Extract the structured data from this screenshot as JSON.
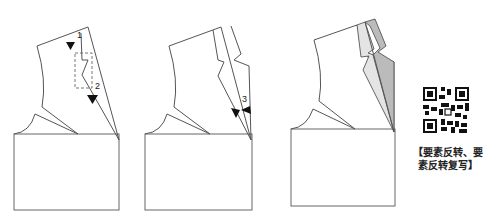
{
  "figure": {
    "panels": [
      {
        "id": "panel-1",
        "labels": [
          "1",
          "2"
        ]
      },
      {
        "id": "panel-2",
        "labels": [
          "3"
        ]
      },
      {
        "id": "panel-3",
        "labels": []
      }
    ],
    "fill_colors": {
      "light": "#e4e4e4",
      "dark": "#b9b9b9"
    }
  },
  "qr": {
    "icon": "qr-code-icon",
    "caption_line1": "【要素反转、要",
    "caption_line2": "素反转复写】"
  }
}
